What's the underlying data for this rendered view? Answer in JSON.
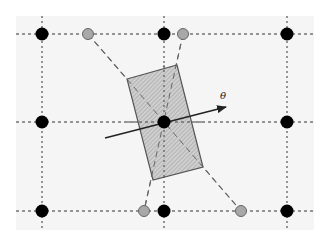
{
  "diagram": {
    "type": "lattice-rotated-cell",
    "background": {
      "panel_color": "#f5f5f5",
      "x": 16,
      "y": 16,
      "width": 298,
      "height": 214
    },
    "grid": {
      "color": "#333333",
      "vertical_x": [
        42,
        164,
        287
      ],
      "horizontal_y": [
        34,
        122,
        211
      ],
      "x_extent": [
        16,
        314
      ],
      "y_extent": [
        16,
        230
      ]
    },
    "lattice_points": {
      "color": "#000000",
      "radius": 6.5,
      "points": [
        [
          42,
          34
        ],
        [
          164,
          34
        ],
        [
          287,
          34
        ],
        [
          42,
          122
        ],
        [
          164,
          122
        ],
        [
          287,
          122
        ],
        [
          42,
          211
        ],
        [
          164,
          211
        ],
        [
          287,
          211
        ]
      ]
    },
    "rotated_points": {
      "fill": "#a8a8a8",
      "stroke": "#666666",
      "radius": 5.5,
      "points": [
        [
          88,
          34
        ],
        [
          183,
          34
        ],
        [
          144,
          211
        ],
        [
          241,
          211
        ]
      ]
    },
    "projection_lines": {
      "color": "#666666",
      "segments": [
        [
          [
            88,
            34
          ],
          [
            241,
            211
          ]
        ],
        [
          [
            183,
            34
          ],
          [
            144,
            211
          ]
        ]
      ]
    },
    "rotated_cell": {
      "fill": "#c4c4c4",
      "stroke": "#555555",
      "corners": [
        [
          127,
          79
        ],
        [
          177,
          65
        ],
        [
          203,
          167
        ],
        [
          153,
          180
        ]
      ]
    },
    "rotation_arrow": {
      "from": [
        105,
        138
      ],
      "to": [
        226,
        107
      ],
      "color": "#222222",
      "label": "θ",
      "label_pos": [
        220,
        99
      ]
    }
  }
}
